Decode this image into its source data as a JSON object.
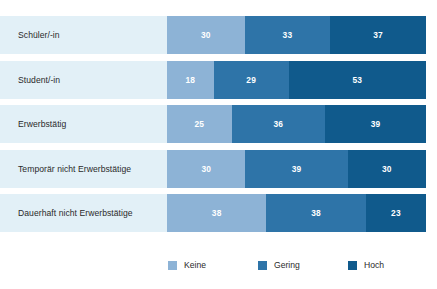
{
  "figure": {
    "title_remnant": "",
    "background_color": "#ffffff",
    "label_band_color": "#e2f0f7"
  },
  "chart_data": {
    "type": "bar",
    "orientation": "horizontal",
    "stacked": true,
    "normalized": "percent",
    "title": "",
    "xlabel": "",
    "ylabel": "",
    "xlim": [
      0,
      100
    ],
    "grid": false,
    "legend_position": "bottom",
    "categories": [
      "Schüler/-in",
      "Student/-in",
      "Erwerbstätig",
      "Temporär nicht Erwerbstätige",
      "Dauerhaft nicht Erwerbstätige"
    ],
    "series": [
      {
        "name": "Keine",
        "color": "#8db3d6",
        "values": [
          30,
          18,
          25,
          30,
          38
        ]
      },
      {
        "name": "Gering",
        "color": "#2e74a8",
        "values": [
          33,
          29,
          36,
          39,
          38
        ]
      },
      {
        "name": "Hoch",
        "color": "#105a8c",
        "values": [
          37,
          53,
          39,
          30,
          23
        ]
      }
    ]
  },
  "legend": {
    "entries": [
      {
        "label": "Keine",
        "color": "#8db3d6"
      },
      {
        "label": "Gering",
        "color": "#2e74a8"
      },
      {
        "label": "Hoch",
        "color": "#105a8c"
      }
    ]
  }
}
